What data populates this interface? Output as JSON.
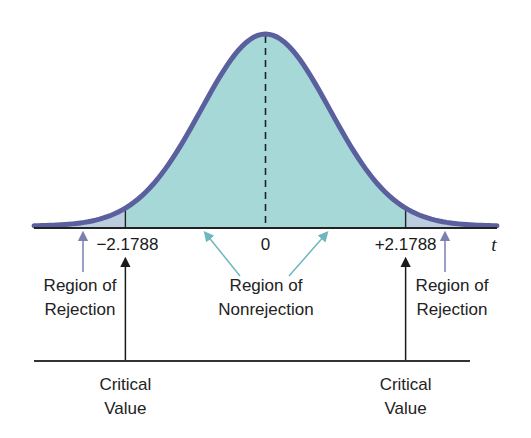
{
  "colors": {
    "nonrejection_fill": "#a6d8d8",
    "rejection_fill": "#bccde0",
    "curve_stroke": "#5a5f9e",
    "axis": "#222222",
    "rejection_arrow": "#7c7fb0",
    "nonrejection_arrow": "#6fb6bf",
    "critical_arrow": "#1a1a1a"
  },
  "chart_data": {
    "type": "area",
    "title": "",
    "distribution": "t (bell curve)",
    "x_variable": "t",
    "center": 0,
    "critical_values": [
      -2.1788,
      2.1788
    ],
    "tick_labels": [
      "−2.1788",
      "0",
      "+2.1788"
    ],
    "regions": [
      {
        "name": "Region of Rejection",
        "from": "-inf",
        "to": -2.1788,
        "color": "#bccde0"
      },
      {
        "name": "Region of Nonrejection",
        "from": -2.1788,
        "to": 2.1788,
        "color": "#a6d8d8"
      },
      {
        "name": "Region of Rejection",
        "from": 2.1788,
        "to": "inf",
        "color": "#bccde0"
      }
    ],
    "xrange": [
      -3.6,
      3.6
    ]
  },
  "labels": {
    "axis_var": "t",
    "tick_left": "−2.1788",
    "tick_center": "0",
    "tick_right": "+2.1788",
    "rejection_left": [
      "Region of",
      "Rejection"
    ],
    "nonrejection": [
      "Region of",
      "Nonrejection"
    ],
    "rejection_right": [
      "Region of",
      "Rejection"
    ],
    "critical_left": [
      "Critical",
      "Value"
    ],
    "critical_right": [
      "Critical",
      "Value"
    ]
  }
}
